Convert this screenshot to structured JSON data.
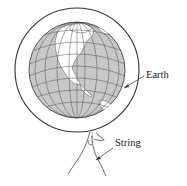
{
  "diagram": {
    "labels": {
      "earth": "Earth",
      "string": "String"
    },
    "colors": {
      "land": "#ffffff",
      "ocean": "#c8c8c8",
      "line": "#333333",
      "background": "#ffffff"
    },
    "elements": [
      "outer-ring",
      "globe",
      "hand",
      "string"
    ]
  }
}
